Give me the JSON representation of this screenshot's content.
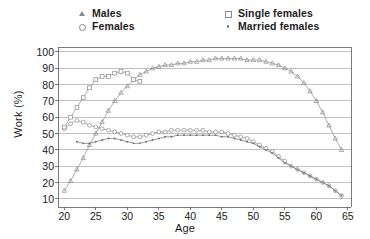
{
  "chart_data": {
    "type": "line",
    "title": "",
    "xlabel": "Age",
    "ylabel": "Work (%)",
    "xlim": [
      19,
      65.5
    ],
    "ylim": [
      5,
      103
    ],
    "xticks": [
      20,
      25,
      30,
      35,
      40,
      45,
      50,
      55,
      60,
      65
    ],
    "yticks": [
      10,
      20,
      30,
      40,
      50,
      60,
      70,
      80,
      90,
      100
    ],
    "grid": "horizontal",
    "legend_position": "above-plot",
    "series": [
      {
        "name": "Males",
        "marker": "triangle",
        "color": "#8a8a8a",
        "x": [
          20,
          21,
          22,
          23,
          24,
          25,
          26,
          27,
          28,
          29,
          30,
          31,
          32,
          33,
          34,
          35,
          36,
          37,
          38,
          39,
          40,
          41,
          42,
          43,
          44,
          45,
          46,
          47,
          48,
          49,
          50,
          51,
          52,
          53,
          54,
          55,
          56,
          57,
          58,
          59,
          60,
          61,
          62,
          63,
          64
        ],
        "y": [
          15,
          21,
          28,
          35,
          43,
          50,
          57,
          64,
          70,
          75,
          79,
          83,
          86,
          88,
          90,
          91,
          92,
          92,
          93,
          93,
          94,
          94,
          95,
          95,
          96,
          96,
          96,
          96,
          96,
          95,
          95,
          95,
          94,
          93,
          92,
          90,
          88,
          85,
          81,
          76,
          70,
          63,
          55,
          47,
          40
        ]
      },
      {
        "name": "Females",
        "marker": "circle",
        "color": "#8a8a8a",
        "x": [
          20,
          21,
          22,
          23,
          24,
          25,
          26,
          27,
          28,
          29,
          30,
          31,
          32,
          33,
          34,
          35,
          36,
          37,
          38,
          39,
          40,
          41,
          42,
          43,
          44,
          45,
          46,
          47,
          48,
          49,
          50,
          51,
          52,
          53,
          54,
          55,
          56,
          57,
          58,
          59,
          60,
          61,
          62,
          63,
          64
        ],
        "y": [
          53,
          56,
          58,
          57,
          55,
          54,
          53,
          52,
          51,
          50,
          49,
          48,
          48,
          49,
          50,
          51,
          51,
          52,
          52,
          52,
          52,
          52,
          52,
          51,
          51,
          51,
          50,
          49,
          48,
          47,
          45,
          43,
          41,
          39,
          36,
          33,
          30,
          28,
          26,
          24,
          22,
          20,
          18,
          15,
          12
        ]
      },
      {
        "name": "Single females",
        "marker": "square",
        "color": "#8a8a8a",
        "x": [
          20,
          21,
          22,
          23,
          24,
          25,
          26,
          27,
          28,
          29,
          30,
          31,
          32
        ],
        "y": [
          54,
          60,
          66,
          72,
          78,
          83,
          85,
          85,
          87,
          88,
          87,
          83,
          82
        ]
      },
      {
        "name": "Married females",
        "marker": "dot",
        "color": "#6f6f6f",
        "x": [
          22,
          23,
          24,
          25,
          26,
          27,
          28,
          29,
          30,
          31,
          32,
          33,
          34,
          35,
          36,
          37,
          38,
          39,
          40,
          41,
          42,
          43,
          44,
          45,
          46,
          47,
          48,
          49,
          50,
          51,
          52,
          53,
          54,
          55,
          56,
          57,
          58,
          59,
          60,
          61,
          62,
          63,
          64
        ],
        "y": [
          45,
          44,
          44,
          45,
          46,
          47,
          47,
          46,
          45,
          44,
          44,
          45,
          46,
          47,
          48,
          48,
          49,
          49,
          49,
          49,
          49,
          49,
          49,
          48,
          48,
          47,
          46,
          45,
          44,
          42,
          40,
          38,
          35,
          32,
          30,
          28,
          26,
          24,
          22,
          20,
          18,
          15,
          12
        ]
      }
    ]
  },
  "legend": {
    "items": [
      {
        "label": "Males",
        "marker": "triangle-marker-icon"
      },
      {
        "label": "Females",
        "marker": "circle-marker-icon"
      },
      {
        "label": "Single females",
        "marker": "square-marker-icon"
      },
      {
        "label": "Married females",
        "marker": "dot-marker-icon"
      }
    ]
  },
  "axes": {
    "y_title": "Work (%)",
    "x_title": "Age",
    "y_tick_labels": [
      "100",
      "90",
      "80",
      "70",
      "60",
      "50",
      "40",
      "30",
      "20",
      "10"
    ],
    "x_tick_labels": [
      "20",
      "25",
      "30",
      "35",
      "40",
      "45",
      "50",
      "55",
      "60",
      "65"
    ]
  },
  "colors": {
    "line": "#8a8a8a",
    "grid": "#9a9a9a",
    "axis": "#5a5a5a",
    "text": "#1a1a1a",
    "background": "#ffffff"
  }
}
